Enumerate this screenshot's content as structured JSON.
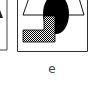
{
  "figure": {
    "panels": [
      {
        "id": "d",
        "partial": true
      },
      {
        "id": "e",
        "label": "e"
      }
    ],
    "shapes": [
      {
        "type": "trapezoid",
        "fill": "#ffffff",
        "stroke": "#000000"
      },
      {
        "type": "ellipse",
        "fill": "#000000"
      },
      {
        "type": "L-shape",
        "fill": "checkered"
      }
    ],
    "colors": {
      "stroke": "#333333",
      "fill_dark": "#000000",
      "background": "#ffffff"
    }
  }
}
